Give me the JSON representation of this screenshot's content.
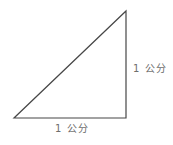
{
  "diagram": {
    "type": "right-triangle",
    "labels": {
      "vertical_leg": "1 公分",
      "horizontal_leg": "1 公分"
    },
    "line_color": "#474747",
    "text_color": "#6e6e6e",
    "background_color": "#ffffff"
  }
}
